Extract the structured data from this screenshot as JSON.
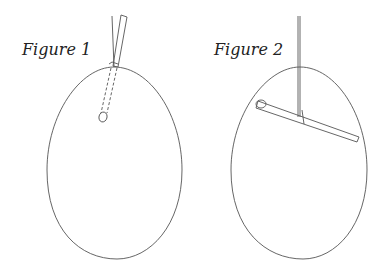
{
  "figures": [
    {
      "label": "Figure 1",
      "description": "Egg with stick inserted through small hole at top; dashed lines show stick inside egg with weight at end"
    },
    {
      "label": "Figure 2",
      "description": "Egg suspended by string with stick rotated horizontally inside the egg"
    }
  ],
  "colors": {
    "line": "#555555",
    "text": "#222222",
    "background": "#ffffff"
  }
}
